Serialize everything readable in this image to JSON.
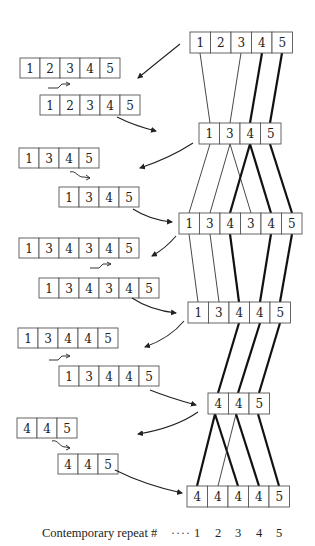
{
  "figure": {
    "caption_label": "Contemporary repeat #",
    "caption_leader": "····",
    "repeat_numbers": [
      "1",
      "2",
      "3",
      "4",
      "5"
    ]
  },
  "right_column": {
    "levels": [
      {
        "cells": [
          "1",
          "2",
          "3",
          "4",
          "5"
        ]
      },
      {
        "cells": [
          "1",
          "3",
          "4",
          "5"
        ]
      },
      {
        "cells": [
          "1",
          "3",
          "4",
          "3",
          "4",
          "5"
        ]
      },
      {
        "cells": [
          "1",
          "3",
          "4",
          "4",
          "5"
        ]
      },
      {
        "cells": [
          "4",
          "4",
          "5"
        ]
      },
      {
        "cells": [
          "4",
          "4",
          "4",
          "4",
          "5"
        ]
      }
    ]
  },
  "left_column": {
    "steps": [
      {
        "before": [
          "1",
          "2",
          "3",
          "4",
          "5"
        ],
        "after": [
          "1",
          "2",
          "3",
          "4",
          "5"
        ],
        "sigil": "shift-right"
      },
      {
        "before": [
          "1",
          "3",
          "4",
          "5"
        ],
        "after": [
          "1",
          "3",
          "4",
          "5"
        ],
        "sigil": "wave-right"
      },
      {
        "before": [
          "1",
          "3",
          "4",
          "3",
          "4",
          "5"
        ],
        "after": [
          "1",
          "3",
          "4",
          "3",
          "4",
          "5"
        ],
        "sigil": "shift-right"
      },
      {
        "before": [
          "1",
          "3",
          "4",
          "4",
          "5"
        ],
        "after": [
          "1",
          "3",
          "4",
          "4",
          "5"
        ],
        "sigil": "shift-right"
      },
      {
        "before": [
          "4",
          "4",
          "5"
        ],
        "after": [
          "4",
          "4",
          "5"
        ],
        "sigil": "wave-right"
      }
    ]
  },
  "colors": {
    "line": "#333333",
    "thick_line": "#111111",
    "box_stroke": "#555555",
    "background": "#ffffff"
  }
}
